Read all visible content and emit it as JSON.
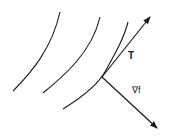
{
  "diagram": {
    "labels": {
      "tangent": "T",
      "gradient": "∇f"
    },
    "colors": {
      "stroke": "#1a1a1a",
      "background": "#ffffff"
    }
  }
}
